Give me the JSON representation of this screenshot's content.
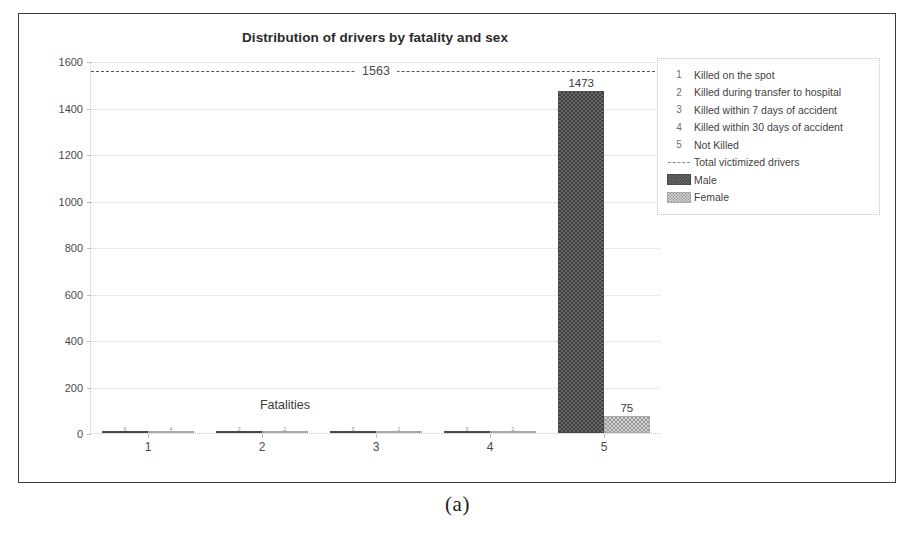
{
  "figure": {
    "caption": "(a)"
  },
  "chart_data": {
    "type": "bar",
    "title": "Distribution of drivers by fatality and sex",
    "xlabel": "Fatalities",
    "ylabel": "Number of victimized drivers",
    "categories": [
      "1",
      "2",
      "3",
      "4",
      "5"
    ],
    "ylim": [
      0,
      1600
    ],
    "yticks": [
      0,
      200,
      400,
      600,
      800,
      1000,
      1200,
      1400,
      1600
    ],
    "grid": true,
    "legend_position": "right-outside",
    "series": [
      {
        "name": "Male",
        "color": "#4a4a4a",
        "values": [
          6,
          3,
          5,
          5,
          1473
        ],
        "labels": [
          "6",
          "3",
          "5",
          "5",
          "1473"
        ]
      },
      {
        "name": "Female",
        "color": "#a8a8a8",
        "values": [
          4,
          2,
          1,
          2,
          75
        ],
        "labels": [
          "4",
          "2",
          "1",
          "2",
          "75"
        ]
      }
    ],
    "reference_line": {
      "name": "Total victimized drivers",
      "value": 1563,
      "label": "1563",
      "style": "dashed",
      "color": "#555555"
    }
  },
  "legend": {
    "key_entries": [
      {
        "key": "1",
        "text": "Killed on the spot"
      },
      {
        "key": "2",
        "text": "Killed during transfer to hospital"
      },
      {
        "key": "3",
        "text": "Killed within 7 days of accident"
      },
      {
        "key": "4",
        "text": "Killed within 30 days of accident"
      },
      {
        "key": "5",
        "text": "Not Killed"
      }
    ],
    "line_entry": {
      "text": "Total victimized drivers"
    },
    "swatch_entries": [
      {
        "text": "Male",
        "swatch": "male-hatch-swatch"
      },
      {
        "text": "Female",
        "swatch": "female-hatch-swatch"
      }
    ]
  }
}
